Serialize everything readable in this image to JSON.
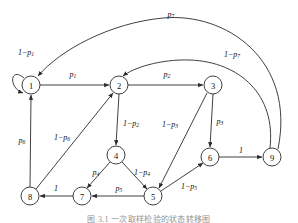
{
  "figure": {
    "caption": "图 3.1  一次取样检验的状态转移图",
    "nodes": [
      {
        "id": "n1",
        "label": "1",
        "cx": 31,
        "cy": 85
      },
      {
        "id": "n2",
        "label": "2",
        "cx": 119,
        "cy": 85
      },
      {
        "id": "n3",
        "label": "3",
        "cx": 213,
        "cy": 85
      },
      {
        "id": "n4",
        "label": "4",
        "cx": 116,
        "cy": 155
      },
      {
        "id": "n5",
        "label": "5",
        "cx": 153,
        "cy": 196
      },
      {
        "id": "n6",
        "label": "6",
        "cx": 210,
        "cy": 157
      },
      {
        "id": "n7",
        "label": "7",
        "cx": 82,
        "cy": 196
      },
      {
        "id": "n8",
        "label": "8",
        "cx": 30,
        "cy": 196
      },
      {
        "id": "n9",
        "label": "9",
        "cx": 272,
        "cy": 157
      }
    ],
    "edges": [
      {
        "from": "1",
        "to": "1",
        "label": "1−p",
        "sub": "1",
        "lx": 26,
        "ly": 52
      },
      {
        "from": "1",
        "to": "2",
        "label": "p",
        "sub": "1",
        "lx": 73,
        "ly": 74
      },
      {
        "from": "2",
        "to": "3",
        "label": "p",
        "sub": "2",
        "lx": 167,
        "ly": 74
      },
      {
        "from": "2",
        "to": "4",
        "label": "1−p",
        "sub": "2",
        "lx": 131,
        "ly": 123
      },
      {
        "from": "3",
        "to": "6",
        "label": "p",
        "sub": "3",
        "lx": 220,
        "ly": 121
      },
      {
        "from": "3",
        "to": "5",
        "label": "1−p",
        "sub": "3",
        "lx": 170,
        "ly": 124
      },
      {
        "from": "4",
        "to": "7",
        "label": "p",
        "sub": "4",
        "lx": 96,
        "ly": 172
      },
      {
        "from": "4",
        "to": "5",
        "label": "1−p",
        "sub": "4",
        "lx": 142,
        "ly": 172
      },
      {
        "from": "5",
        "to": "7",
        "label": "p",
        "sub": "5",
        "lx": 119,
        "ly": 188
      },
      {
        "from": "5",
        "to": "6",
        "label": "1−p",
        "sub": "5",
        "lx": 189,
        "ly": 186
      },
      {
        "from": "6",
        "to": "9",
        "label": "1",
        "sub": "",
        "lx": 241,
        "ly": 150
      },
      {
        "from": "7",
        "to": "8",
        "label": "1",
        "sub": "",
        "lx": 56,
        "ly": 188
      },
      {
        "from": "8",
        "to": "1",
        "label": "p",
        "sub": "6",
        "lx": 22,
        "ly": 140
      },
      {
        "from": "8",
        "to": "2",
        "label": "1−p",
        "sub": "6",
        "lx": 62,
        "ly": 137
      },
      {
        "from": "9",
        "to": "1",
        "label": "p",
        "sub": "7",
        "lx": 171,
        "ly": 14
      },
      {
        "from": "9",
        "to": "2",
        "label": "1−p",
        "sub": "7",
        "lx": 232,
        "ly": 54
      }
    ]
  }
}
